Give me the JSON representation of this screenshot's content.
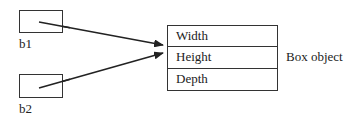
{
  "references": [
    {
      "name": "b1"
    },
    {
      "name": "b2"
    }
  ],
  "object": {
    "label": "Box object",
    "fields": [
      {
        "name": "Width"
      },
      {
        "name": "Height"
      },
      {
        "name": "Depth"
      }
    ]
  },
  "colors": {
    "stroke": "#333333",
    "background": "#ffffff"
  }
}
